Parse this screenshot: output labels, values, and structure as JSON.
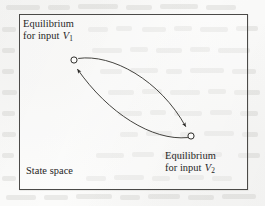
{
  "figure": {
    "name": "state-space-equilibrium-transition-diagram",
    "canvas": {
      "width": 265,
      "height": 206
    },
    "background_color": "#fbfbfa",
    "ink_color": "#26251f",
    "border_color": "#4b4a48"
  },
  "box": {
    "caption": "State space"
  },
  "labels": {
    "equilibrium_1": {
      "line1": "Equilibrium",
      "line2_prefix": "for input ",
      "variable": "V",
      "subscript": "1"
    },
    "equilibrium_2": {
      "line1": "Equilibrium",
      "line2_prefix": "for input ",
      "variable": "V",
      "subscript": "2"
    }
  },
  "nodes": [
    {
      "id": "equilibrium-1",
      "cx": 74,
      "cy": 60,
      "r": 3.1,
      "style": "hollow-circle"
    },
    {
      "id": "equilibrium-2",
      "cx": 191,
      "cy": 136,
      "r": 3.1,
      "style": "hollow-circle"
    }
  ],
  "edges": [
    {
      "id": "transition-v1-to-v2",
      "from": "equilibrium-1",
      "to": "equilibrium-2",
      "direction": "forward",
      "curvature": "bows-upward",
      "path": "M 78.6 58.4 C 112 53.6 160 80 185.6 126.4",
      "arrow_tip": {
        "x": 187.4,
        "y": 129.6
      }
    },
    {
      "id": "transition-v2-to-v1",
      "from": "equilibrium-2",
      "to": "equilibrium-1",
      "direction": "forward",
      "curvature": "bows-downward",
      "path": "M 187.5 137.6 C 152 141 108 113 77.6 69.4",
      "arrow_tip": {
        "x": 75.8,
        "y": 66.2
      }
    }
  ],
  "bleed_marks": [
    {
      "x": 6,
      "y": 5,
      "w": 34
    },
    {
      "x": 48,
      "y": 5,
      "w": 22
    },
    {
      "x": 78,
      "y": 4,
      "w": 40
    },
    {
      "x": 126,
      "y": 5,
      "w": 26
    },
    {
      "x": 160,
      "y": 4,
      "w": 38
    },
    {
      "x": 206,
      "y": 5,
      "w": 30
    },
    {
      "x": 2,
      "y": 27,
      "w": 14
    },
    {
      "x": 88,
      "y": 27,
      "w": 20
    },
    {
      "x": 116,
      "y": 26,
      "w": 16
    },
    {
      "x": 142,
      "y": 27,
      "w": 24
    },
    {
      "x": 174,
      "y": 26,
      "w": 18
    },
    {
      "x": 200,
      "y": 27,
      "w": 28
    },
    {
      "x": 236,
      "y": 26,
      "w": 22
    },
    {
      "x": 2,
      "y": 48,
      "w": 13
    },
    {
      "x": 92,
      "y": 48,
      "w": 30
    },
    {
      "x": 130,
      "y": 47,
      "w": 18
    },
    {
      "x": 156,
      "y": 48,
      "w": 26
    },
    {
      "x": 190,
      "y": 47,
      "w": 20
    },
    {
      "x": 218,
      "y": 48,
      "w": 32
    },
    {
      "x": 2,
      "y": 69,
      "w": 12
    },
    {
      "x": 100,
      "y": 69,
      "w": 22
    },
    {
      "x": 130,
      "y": 68,
      "w": 28
    },
    {
      "x": 166,
      "y": 69,
      "w": 16
    },
    {
      "x": 190,
      "y": 68,
      "w": 34
    },
    {
      "x": 232,
      "y": 69,
      "w": 24
    },
    {
      "x": 2,
      "y": 90,
      "w": 15
    },
    {
      "x": 108,
      "y": 90,
      "w": 26
    },
    {
      "x": 142,
      "y": 89,
      "w": 20
    },
    {
      "x": 170,
      "y": 90,
      "w": 30
    },
    {
      "x": 208,
      "y": 89,
      "w": 18
    },
    {
      "x": 234,
      "y": 90,
      "w": 26
    },
    {
      "x": 2,
      "y": 111,
      "w": 13
    },
    {
      "x": 118,
      "y": 111,
      "w": 24
    },
    {
      "x": 150,
      "y": 110,
      "w": 16
    },
    {
      "x": 174,
      "y": 111,
      "w": 28
    },
    {
      "x": 210,
      "y": 110,
      "w": 22
    },
    {
      "x": 240,
      "y": 111,
      "w": 18
    },
    {
      "x": 2,
      "y": 132,
      "w": 14
    },
    {
      "x": 120,
      "y": 132,
      "w": 18
    },
    {
      "x": 146,
      "y": 131,
      "w": 26
    },
    {
      "x": 180,
      "y": 132,
      "w": 14
    },
    {
      "x": 204,
      "y": 131,
      "w": 30
    },
    {
      "x": 242,
      "y": 132,
      "w": 16
    },
    {
      "x": 2,
      "y": 153,
      "w": 12
    },
    {
      "x": 96,
      "y": 153,
      "w": 28
    },
    {
      "x": 132,
      "y": 152,
      "w": 22
    },
    {
      "x": 162,
      "y": 153,
      "w": 34
    },
    {
      "x": 204,
      "y": 152,
      "w": 18
    },
    {
      "x": 238,
      "y": 153,
      "w": 22
    },
    {
      "x": 2,
      "y": 176,
      "w": 14
    },
    {
      "x": 86,
      "y": 176,
      "w": 20
    },
    {
      "x": 114,
      "y": 175,
      "w": 30
    },
    {
      "x": 152,
      "y": 176,
      "w": 18
    },
    {
      "x": 178,
      "y": 175,
      "w": 26
    },
    {
      "x": 212,
      "y": 176,
      "w": 20
    },
    {
      "x": 6,
      "y": 195,
      "w": 30
    },
    {
      "x": 44,
      "y": 195,
      "w": 24
    },
    {
      "x": 76,
      "y": 194,
      "w": 36
    },
    {
      "x": 120,
      "y": 195,
      "w": 20
    },
    {
      "x": 148,
      "y": 194,
      "w": 32
    },
    {
      "x": 188,
      "y": 195,
      "w": 26
    },
    {
      "x": 222,
      "y": 194,
      "w": 34
    }
  ]
}
